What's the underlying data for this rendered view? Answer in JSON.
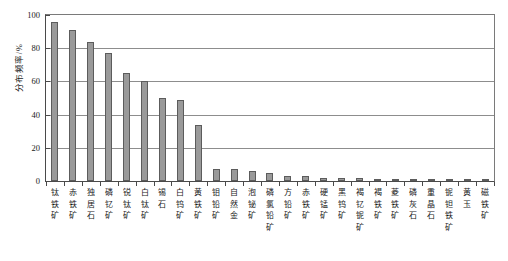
{
  "chart_data": {
    "type": "bar",
    "title": "",
    "xlabel": "",
    "ylabel": "分布频率/%",
    "ylim": [
      0,
      100
    ],
    "yticks": [
      0,
      20,
      40,
      60,
      80,
      100
    ],
    "ytick_labels": [
      "0",
      "20",
      "40",
      "60",
      "80",
      "100"
    ],
    "grid": true,
    "legend": "none",
    "bar_color": "#9a9a9a",
    "bar_edge_color": "#5c5c5c",
    "categories": [
      "钛铁矿",
      "赤铁矿",
      "独居石",
      "磷钇矿",
      "锐钛矿",
      "白钛矿",
      "锡石",
      "白钨矿",
      "黄铁矿",
      "钼铅矿",
      "自然金",
      "泡铋矿",
      "磷氯铅矿",
      "方铅矿",
      "赤铁矿",
      "硬锰矿",
      "黑钨矿",
      "褐钇铌矿",
      "褐铁矿",
      "菱铁矿",
      "磷灰石",
      "重晶石",
      "铌钽铁矿",
      "黄玉",
      "磁铁矿"
    ],
    "values": [
      96,
      91,
      84,
      77,
      65,
      60,
      50,
      49,
      34,
      7,
      7,
      6,
      5,
      3,
      3,
      2,
      2,
      2,
      1.5,
      1.5,
      1,
      1,
      1,
      0.8,
      0.8
    ]
  }
}
